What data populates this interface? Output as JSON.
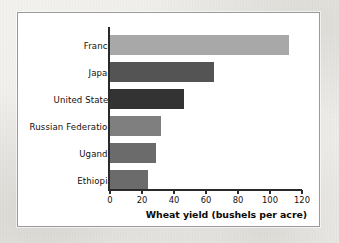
{
  "chart_data": {
    "type": "bar",
    "orientation": "horizontal",
    "title": "",
    "xlabel": "Wheat yield (bushels per acre)",
    "ylabel": "",
    "xlim": [
      0,
      120
    ],
    "xticks": [
      0,
      20,
      40,
      60,
      80,
      100,
      120
    ],
    "xtick_labels": [
      "0",
      "20",
      "40",
      "60",
      "80",
      "100",
      "120"
    ],
    "grid": false,
    "legend": "none",
    "categories": [
      "France",
      "Japan",
      "United States",
      "Russian Federation",
      "Uganda",
      "Ethiopia"
    ],
    "values": [
      112,
      65,
      46,
      32,
      29,
      24
    ],
    "bar_colors": [
      "#a8a8a8",
      "#545454",
      "#333333",
      "#7f7f7f",
      "#6b6b6b",
      "#6b6b6b"
    ],
    "bars": [
      {
        "label": "France",
        "value": 112,
        "color": "#a8a8a8"
      },
      {
        "label": "Japan",
        "value": 65,
        "color": "#545454"
      },
      {
        "label": "United States",
        "value": 46,
        "color": "#333333"
      },
      {
        "label": "Russian Federation",
        "value": 32,
        "color": "#7f7f7f"
      },
      {
        "label": "Uganda",
        "value": 29,
        "color": "#6b6b6b"
      },
      {
        "label": "Ethiopia",
        "value": 24,
        "color": "#6b6b6b"
      }
    ]
  },
  "figure": {
    "frame_color": "#9a9a9a",
    "background_color": "#ffffff",
    "page_background_color": "#f2f1ee",
    "axis_color": "#2a2a2a"
  }
}
